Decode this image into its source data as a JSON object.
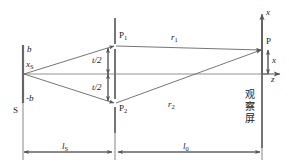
{
  "figure": {
    "type": "optics-ray-diagram",
    "stroke_color": "#555555",
    "text_color": "#1a1a1a",
    "background": "#ffffff",
    "width": 289,
    "height": 167
  },
  "labels": {
    "source_height": "x",
    "source_height_sub": "S",
    "aperture_top": "b",
    "aperture_bottom": "-b",
    "source_screen": "S",
    "slit_top": "P",
    "slit_top_sub": "1",
    "slit_bottom": "P",
    "slit_bottom_sub": "2",
    "half_sep_top": "t/2",
    "half_sep_bottom": "t/2",
    "ray_top": "r",
    "ray_top_sub": "1",
    "ray_bottom": "r",
    "ray_bottom_sub": "2",
    "field_point": "P",
    "field_offset": "x",
    "axis_vertical": "x",
    "axis_horizontal": "z",
    "observation_screen": [
      "观",
      "察",
      "屏"
    ],
    "dist_source_to_slits": "l",
    "dist_source_to_slits_sub": "S",
    "dist_slits_to_screen": "l",
    "dist_slits_to_screen_sub": "0"
  },
  "geometry": {
    "source_plane_x": 23,
    "slit_plane_x": 115,
    "screen_plane_x": 262,
    "optical_axis_y": 74,
    "slit_top_y": 45,
    "slit_bottom_y": 103,
    "field_point_y": 50,
    "dimension_line_y": 152
  }
}
